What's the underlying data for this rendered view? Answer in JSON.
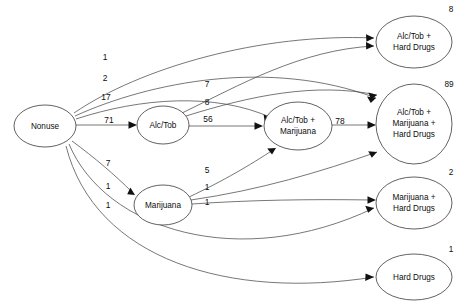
{
  "diagram": {
    "nodes": [
      {
        "id": "nonuse",
        "label_lines": [
          "Nonuse"
        ],
        "count": "",
        "cx": 45,
        "cy": 126,
        "rx": 31,
        "ry": 21
      },
      {
        "id": "alctob",
        "label_lines": [
          "Alc/Tob"
        ],
        "count": "",
        "cx": 163,
        "cy": 125,
        "rx": 26,
        "ry": 19
      },
      {
        "id": "alctob_mj",
        "label_lines": [
          "Alc/Tob +",
          "Marijuana"
        ],
        "count": "",
        "cx": 298,
        "cy": 126,
        "rx": 34,
        "ry": 24
      },
      {
        "id": "marijuana",
        "label_lines": [
          "Marijuana"
        ],
        "count": "",
        "cx": 163,
        "cy": 205,
        "rx": 29,
        "ry": 20
      },
      {
        "id": "alctob_hd",
        "label_lines": [
          "Alc/Tob +",
          "Hard Drugs"
        ],
        "count": "8",
        "cx": 414,
        "cy": 42,
        "rx": 38,
        "ry": 26
      },
      {
        "id": "alctob_mj_hd",
        "label_lines": [
          "Alc/Tob +",
          "Marijuana +",
          "Hard Drugs"
        ],
        "count": "89",
        "cx": 414,
        "cy": 124,
        "rx": 38,
        "ry": 40
      },
      {
        "id": "mj_hd",
        "label_lines": [
          "Marijuana +",
          "Hard Drugs"
        ],
        "count": "2",
        "cx": 414,
        "cy": 203,
        "rx": 38,
        "ry": 26
      },
      {
        "id": "hd",
        "label_lines": [
          "Hard Drugs"
        ],
        "count": "1",
        "cx": 414,
        "cy": 277,
        "rx": 38,
        "ry": 23
      }
    ],
    "edges": [
      {
        "from": "nonuse",
        "to": "alctob_hd",
        "value": "1",
        "label_x": 105,
        "label_y": 60
      },
      {
        "from": "nonuse",
        "to": "alctob_mj_hd",
        "value": "2",
        "label_x": 105,
        "label_y": 81
      },
      {
        "from": "nonuse",
        "to": "alctob_mj",
        "value": "17",
        "label_x": 106,
        "label_y": 100
      },
      {
        "from": "nonuse",
        "to": "alctob",
        "value": "71",
        "label_x": 109,
        "label_y": 123
      },
      {
        "from": "nonuse",
        "to": "marijuana",
        "value": "7",
        "label_x": 108,
        "label_y": 166
      },
      {
        "from": "nonuse",
        "to": "mj_hd",
        "value": "1",
        "label_x": 108,
        "label_y": 189
      },
      {
        "from": "nonuse",
        "to": "hd",
        "value": "1",
        "label_x": 108,
        "label_y": 208
      },
      {
        "from": "alctob",
        "to": "alctob_hd",
        "value": "7",
        "label_x": 207,
        "label_y": 87
      },
      {
        "from": "alctob",
        "to": "alctob_mj_hd",
        "value": "8",
        "label_x": 207,
        "label_y": 105
      },
      {
        "from": "alctob",
        "to": "alctob_mj",
        "value": "56",
        "label_x": 208,
        "label_y": 122
      },
      {
        "from": "marijuana",
        "to": "alctob_mj",
        "value": "5",
        "label_x": 207,
        "label_y": 173
      },
      {
        "from": "marijuana",
        "to": "alctob_mj_hd",
        "value": "1",
        "label_x": 207,
        "label_y": 190
      },
      {
        "from": "marijuana",
        "to": "mj_hd",
        "value": "1",
        "label_x": 207,
        "label_y": 205
      },
      {
        "from": "alctob_mj",
        "to": "alctob_mj_hd",
        "value": "78",
        "label_x": 340,
        "label_y": 124
      }
    ]
  }
}
